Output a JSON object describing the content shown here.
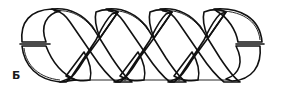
{
  "figure": {
    "label": "Б",
    "turns": 3,
    "colors": {
      "outline": "#111111",
      "ribbon_front": "#ffffff",
      "ribbon_back": "#b4b4b4",
      "background": "#ffffff"
    }
  }
}
